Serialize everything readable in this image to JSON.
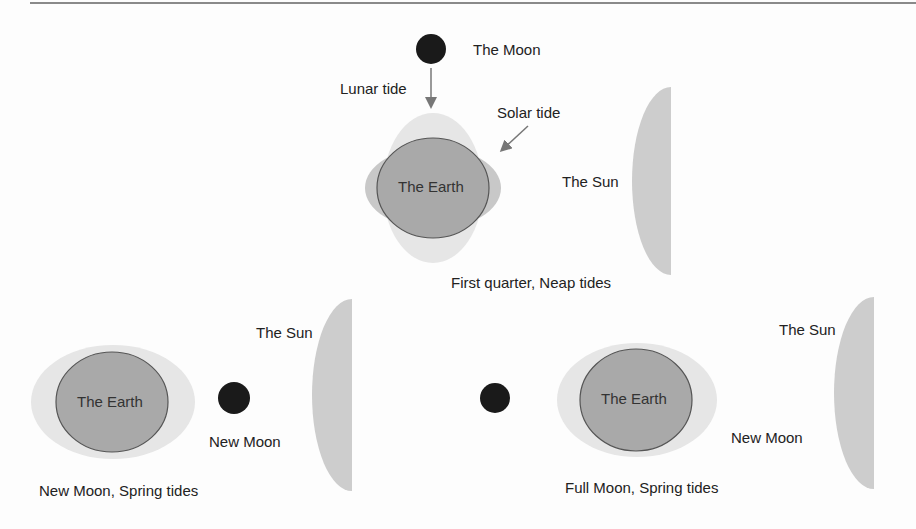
{
  "colors": {
    "earth": "#a9a9a9",
    "earth_stroke": "#555555",
    "lunar_bulge": "#e6e6e6",
    "solar_bulge": "#c8c8c8",
    "sun": "#cdcdcd",
    "moon": "#1a1a1a",
    "arrow": "#777777",
    "top_rule": "#8a8a8a"
  },
  "panels": {
    "first_quarter": {
      "caption": "First quarter, Neap tides",
      "moon_label": "The Moon",
      "lunar_tide_label": "Lunar tide",
      "solar_tide_label": "Solar tide",
      "earth_label": "The Earth",
      "sun_label": "The Sun"
    },
    "new_moon": {
      "caption": "New Moon, Spring tides",
      "earth_label": "The Earth",
      "moon_label": "New Moon",
      "sun_label": "The Sun"
    },
    "full_moon": {
      "caption": "Full Moon, Spring tides",
      "earth_label": "The Earth",
      "moon_label": "New Moon",
      "sun_label": "The Sun"
    }
  }
}
